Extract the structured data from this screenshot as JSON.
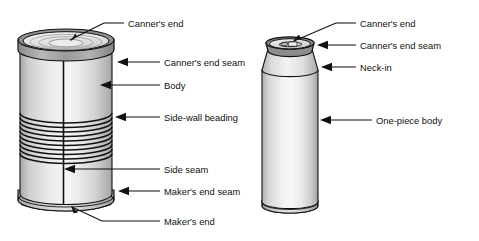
{
  "figure": {
    "type": "technical-diagram",
    "background_color": "#ffffff",
    "line_color": "#111111"
  },
  "cans": [
    {
      "id": "three-piece-can",
      "name": "three-piece-can",
      "description": "Three-piece food can with side-wall beading",
      "labels": [
        {
          "key": "canners_end",
          "text": "Canner's end",
          "pointer": "line-arrow-down"
        },
        {
          "key": "canners_end_seam",
          "text": "Canner's end seam",
          "pointer": "left-arrow"
        },
        {
          "key": "body",
          "text": "Body",
          "pointer": "left-arrow"
        },
        {
          "key": "side_wall_beading",
          "text": "Side-wall beading",
          "pointer": "left-arrow"
        },
        {
          "key": "side_seam",
          "text": "Side seam",
          "pointer": "left-arrow"
        },
        {
          "key": "makers_end_seam",
          "text": "Maker's end seam",
          "pointer": "left-arrow"
        },
        {
          "key": "makers_end",
          "text": "Maker's end",
          "pointer": "line-arrow-up"
        }
      ],
      "bead_count": 10
    },
    {
      "id": "two-piece-can",
      "name": "two-piece-beverage-can",
      "description": "Two-piece beverage can with neck-in and pull tab",
      "labels": [
        {
          "key": "canners_end",
          "text": "Canner's end",
          "pointer": "line-arrow-down"
        },
        {
          "key": "canners_end_seam",
          "text": "Canner's end seam",
          "pointer": "left-arrow"
        },
        {
          "key": "neck_in",
          "text": "Neck-in",
          "pointer": "left-arrow"
        },
        {
          "key": "one_piece_body",
          "text": "One-piece body",
          "pointer": "left-arrow"
        }
      ]
    }
  ],
  "colors": {
    "metal_light": "#f2f2f2",
    "metal_mid": "#d8d8d8",
    "metal_dark": "#a8a8a8",
    "rim_dark": "#6e6e6e",
    "stroke": "#111111"
  }
}
